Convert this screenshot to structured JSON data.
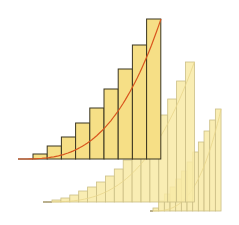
{
  "colors": {
    "background": "#ffffff",
    "front_fill": "#f6df86",
    "front_stroke": "#3b3621",
    "back_fill": "#f8eaa6",
    "back_stroke": "#cbbf86",
    "curve": "#d9561e",
    "baseline": "#5a5448"
  },
  "panels": [
    {
      "name": "back-right",
      "baseline_y": 211,
      "axis_start_x": 150,
      "bar_left_x": 153,
      "bar_width": 5.67,
      "bar_tops": [
        208,
        201,
        194,
        187,
        179,
        171,
        162,
        152,
        142,
        131,
        120,
        109
      ],
      "style": "back"
    },
    {
      "name": "middle",
      "baseline_y": 202,
      "axis_start_x": 43,
      "bar_left_x": 52,
      "bar_width": 8.9,
      "bar_tops": [
        200,
        198,
        195,
        191,
        187,
        182,
        176,
        169,
        160,
        151,
        141,
        129,
        115,
        99,
        81,
        62
      ],
      "style": "back"
    },
    {
      "name": "front",
      "baseline_y": 159,
      "axis_start_x": 18,
      "bar_left_x": 33,
      "bar_width": 14.2,
      "bar_tops": [
        154,
        146,
        137,
        123,
        108,
        89,
        69,
        45,
        19
      ],
      "style": "front",
      "curve": {
        "x_start": 18,
        "x_end": 161,
        "y_base": 159,
        "y_top": 19,
        "exponent": 3
      }
    }
  ]
}
